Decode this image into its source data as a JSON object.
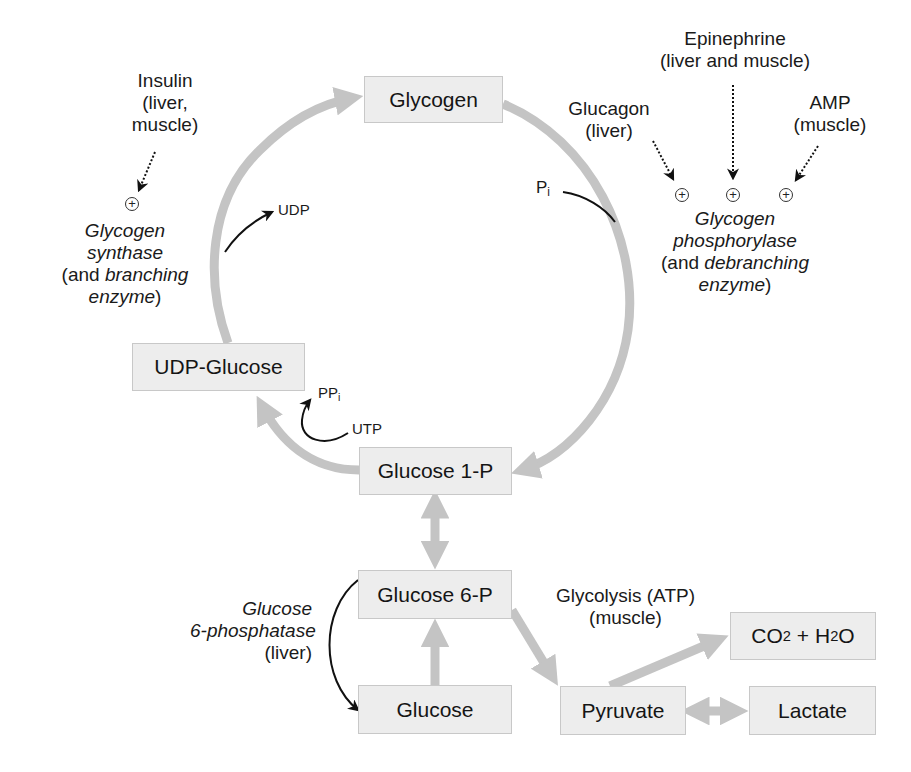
{
  "diagram": {
    "nodes": {
      "glycogen": "Glycogen",
      "udp_glucose": "UDP-Glucose",
      "glucose_1p": "Glucose 1-P",
      "glucose_6p": "Glucose 6-P",
      "glucose": "Glucose",
      "pyruvate": "Pyruvate",
      "lactate": "Lactate",
      "co2_h2o": {
        "co": "CO",
        "sub1": "2",
        "plus_h": " + H",
        "sub2": "2",
        "o": "O"
      }
    },
    "regulators": {
      "insulin": {
        "name": "Insulin",
        "line2": "(liver,",
        "line3": "muscle)"
      },
      "epinephrine": {
        "name": "Epinephrine",
        "line2": "(liver and muscle)"
      },
      "glucagon": {
        "name": "Glucagon",
        "line2": "(liver)"
      },
      "amp": {
        "name": "AMP",
        "line2": "(muscle)"
      },
      "activation_symbol": "+"
    },
    "enzymes": {
      "synthase": {
        "line1": "Glycogen",
        "line2": "synthase",
        "line3_prefix": "(and ",
        "line3_italic": "branching",
        "line4_italic": "enzyme",
        "line4_suffix": ")"
      },
      "phosphorylase": {
        "line1": "Glycogen",
        "line2": "phosphorylase",
        "line3_prefix": "(and ",
        "line3_italic": "debranching",
        "line4_italic": "enzyme",
        "line4_suffix": ")"
      },
      "g6pase": {
        "line1": "Glucose",
        "line2": "6-phosphatase",
        "line3": "(liver)"
      }
    },
    "cofactors": {
      "udp": "UDP",
      "pi": {
        "p": "P",
        "sub": "i"
      },
      "ppi": {
        "pp": "PP",
        "sub": "i"
      },
      "utp": "UTP"
    },
    "pathway_labels": {
      "glycolysis": "Glycolysis (ATP)",
      "glycolysis_tissue": "(muscle)"
    },
    "colors": {
      "pathway_arrow": "#c4c4c4",
      "box_fill": "#ededed",
      "box_border": "#c8c8c8",
      "reaction_arrow": "#111111"
    }
  }
}
